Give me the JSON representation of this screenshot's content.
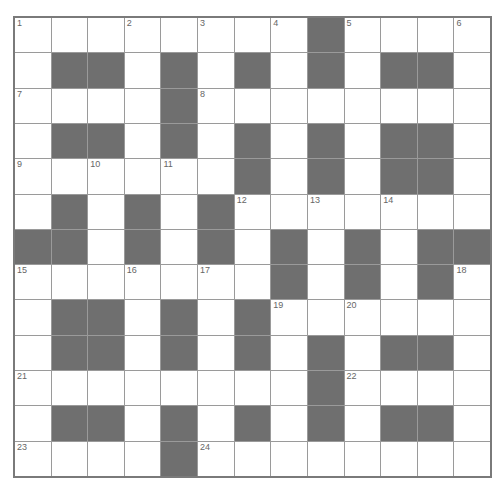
{
  "puzzle": {
    "type": "crossword",
    "rows": 13,
    "cols": 13,
    "colors": {
      "block": "#6f6f6f",
      "cell": "#ffffff",
      "gridline": "#9a9a9a",
      "border": "#7a7a7a",
      "number": "#666666"
    },
    "grid": [
      "........#....",
      ".##.#.#.#.##.",
      "....#........",
      ".##.#.#.#.##.",
      "......#.#.##.",
      ".#.#.#.......",
      "##.#.#.#.#.##",
      ".......#.#.#.",
      ".##.#.#......",
      ".##.#.#.#.##.",
      "........#....",
      ".##.#.#.#.##.",
      "....#........"
    ],
    "numbers": [
      {
        "row": 0,
        "col": 0,
        "n": "1"
      },
      {
        "row": 0,
        "col": 3,
        "n": "2"
      },
      {
        "row": 0,
        "col": 5,
        "n": "3"
      },
      {
        "row": 0,
        "col": 7,
        "n": "4"
      },
      {
        "row": 0,
        "col": 9,
        "n": "5"
      },
      {
        "row": 0,
        "col": 12,
        "n": "6"
      },
      {
        "row": 2,
        "col": 0,
        "n": "7"
      },
      {
        "row": 2,
        "col": 5,
        "n": "8"
      },
      {
        "row": 4,
        "col": 0,
        "n": "9"
      },
      {
        "row": 4,
        "col": 2,
        "n": "10"
      },
      {
        "row": 4,
        "col": 4,
        "n": "11"
      },
      {
        "row": 5,
        "col": 6,
        "n": "12"
      },
      {
        "row": 5,
        "col": 8,
        "n": "13"
      },
      {
        "row": 5,
        "col": 10,
        "n": "14"
      },
      {
        "row": 7,
        "col": 0,
        "n": "15"
      },
      {
        "row": 7,
        "col": 3,
        "n": "16"
      },
      {
        "row": 7,
        "col": 5,
        "n": "17"
      },
      {
        "row": 7,
        "col": 12,
        "n": "18"
      },
      {
        "row": 8,
        "col": 7,
        "n": "19"
      },
      {
        "row": 8,
        "col": 9,
        "n": "20"
      },
      {
        "row": 10,
        "col": 0,
        "n": "21"
      },
      {
        "row": 10,
        "col": 9,
        "n": "22"
      },
      {
        "row": 12,
        "col": 0,
        "n": "23"
      },
      {
        "row": 12,
        "col": 5,
        "n": "24"
      }
    ]
  }
}
